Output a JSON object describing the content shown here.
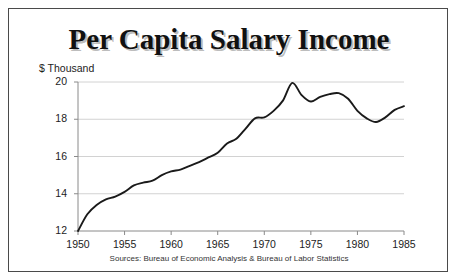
{
  "chart_data": {
    "type": "line",
    "title": "Per Capita Salary Income",
    "ylabel": "$ Thousand",
    "xlabel": "",
    "source_note": "Sources: Bureau of Economic Analysis & Bureau of Labor Statistics",
    "xlim": [
      1950,
      1985
    ],
    "ylim": [
      12,
      20
    ],
    "grid": true,
    "legend": "none",
    "yticks": [
      12,
      14,
      16,
      18,
      20
    ],
    "ytick_labels": [
      "12",
      "14",
      "16",
      "18",
      "20"
    ],
    "xticks": [
      1950,
      1955,
      1960,
      1965,
      1970,
      1975,
      1980,
      1985
    ],
    "xtick_labels": [
      "1950",
      "1955",
      "1960",
      "1965",
      "1970",
      "1975",
      "1980",
      "1985"
    ],
    "series": [
      {
        "name": "Per Capita Salary Income",
        "color": "#1a1a1a",
        "x": [
          1950,
          1951,
          1952,
          1953,
          1954,
          1955,
          1956,
          1957,
          1958,
          1959,
          1960,
          1961,
          1962,
          1963,
          1964,
          1965,
          1966,
          1967,
          1968,
          1969,
          1970,
          1971,
          1972,
          1973,
          1974,
          1975,
          1976,
          1977,
          1978,
          1979,
          1980,
          1981,
          1982,
          1983,
          1984,
          1985
        ],
        "values": [
          12.0,
          12.9,
          13.4,
          13.7,
          13.85,
          14.1,
          14.45,
          14.6,
          14.7,
          15.0,
          15.2,
          15.3,
          15.5,
          15.7,
          15.95,
          16.2,
          16.7,
          16.95,
          17.5,
          18.05,
          18.1,
          18.45,
          19.0,
          19.95,
          19.3,
          18.95,
          19.2,
          19.35,
          19.4,
          19.1,
          18.45,
          18.05,
          17.85,
          18.1,
          18.5,
          18.7
        ]
      }
    ]
  },
  "figure": {
    "title": "Per Capita Salary Income",
    "axis_label_y": "$ Thousand",
    "source": "Sources: Bureau of Economic Analysis & Bureau of Labor Statistics"
  }
}
